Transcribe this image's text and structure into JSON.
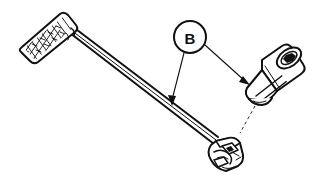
{
  "figure": {
    "background_color": "#ffffff",
    "ink_color": "#111111",
    "width": 312,
    "height": 183
  },
  "callout": {
    "label": "B",
    "shape": "circle",
    "center_x": 190,
    "center_y": 37,
    "radius": 16,
    "leader_count": 2,
    "leaders": [
      {
        "name": "leader-to-shaft",
        "from_x": 184,
        "from_y": 53,
        "to_x": 172,
        "to_y": 104,
        "arrow": "down-left"
      },
      {
        "name": "leader-to-socket",
        "from_x": 205,
        "from_y": 44,
        "to_x": 247,
        "to_y": 83,
        "arrow": "down-right"
      }
    ]
  },
  "parts": [
    {
      "name": "handle-grip",
      "description": "knurled cross-hatched handle grip",
      "pattern": "cross-hatch-knurl"
    },
    {
      "name": "wrench-shaft",
      "description": "long tapered round shaft",
      "pattern": "double-line"
    },
    {
      "name": "drive-head",
      "description": "square drive head with detent ball and cam",
      "pattern": "outline"
    },
    {
      "name": "socket",
      "description": "deep socket with hex opening and ringed knurl band",
      "pattern": "outline-with-rings"
    },
    {
      "name": "alignment-line",
      "description": "broken alignment line from socket base to drive lug",
      "pattern": "dashed"
    }
  ]
}
